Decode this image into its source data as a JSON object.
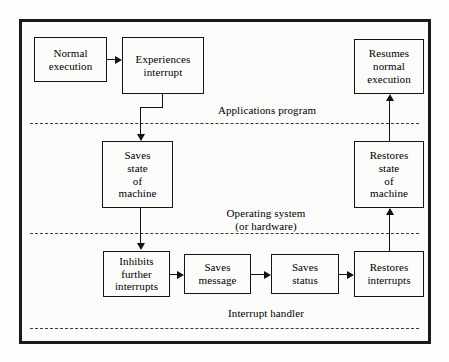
{
  "diagram": {
    "background_color": "#fbfbfa",
    "line_color": "#111111",
    "boxes": [
      {
        "id": "normal-execution",
        "label": "Normal\nexecution"
      },
      {
        "id": "experiences-interrupt",
        "label": "Experiences\ninterrupt"
      },
      {
        "id": "resumes-normal",
        "label": "Resumes\nnormal\nexecution"
      },
      {
        "id": "saves-state",
        "label": "Saves\nstate\nof\nmachine"
      },
      {
        "id": "restores-state",
        "label": "Restores\nstate\nof\nmachine"
      },
      {
        "id": "inhibits-further",
        "label": "Inhibits\nfurther\ninterrupts"
      },
      {
        "id": "saves-message",
        "label": "Saves\nmessage"
      },
      {
        "id": "saves-status",
        "label": "Saves\nstatus"
      },
      {
        "id": "restores-interrupts",
        "label": "Restores\ninterrupts"
      }
    ],
    "zones": [
      {
        "id": "applications-program",
        "label": "Applications program"
      },
      {
        "id": "operating-system",
        "label": "Operating system\n(or hardware)"
      },
      {
        "id": "interrupt-handler",
        "label": "Interrupt handler"
      }
    ]
  }
}
